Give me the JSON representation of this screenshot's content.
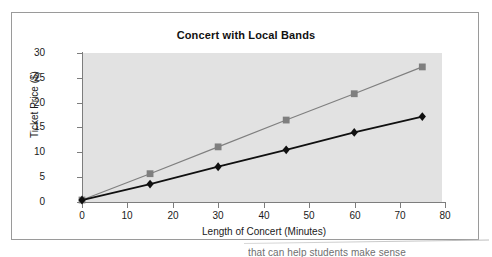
{
  "chart_data": {
    "type": "line",
    "title": "Concert with Local Bands",
    "xlabel": "Length of Concert (Minutes)",
    "ylabel": "Ticket Price ($)",
    "xlim": [
      0,
      80
    ],
    "ylim": [
      0,
      30
    ],
    "xticks": [
      0,
      10,
      20,
      30,
      40,
      50,
      60,
      70,
      80
    ],
    "yticks": [
      0,
      5,
      10,
      15,
      20,
      25,
      30
    ],
    "grid": false,
    "legend": "none",
    "plot_background": "#e2e2e2",
    "x": [
      0,
      15,
      30,
      45,
      60,
      75
    ],
    "series": [
      {
        "name": "gray-square-series",
        "marker": "square",
        "color": "#7f7f7f",
        "values": [
          0.4,
          5.7,
          11.1,
          16.5,
          21.8,
          27.2
        ]
      },
      {
        "name": "black-diamond-series",
        "marker": "diamond",
        "color": "#101010",
        "values": [
          0.4,
          3.6,
          7.1,
          10.5,
          14.0,
          17.2
        ]
      }
    ]
  },
  "page": {
    "caption_fragment": "that can help students make sense"
  }
}
